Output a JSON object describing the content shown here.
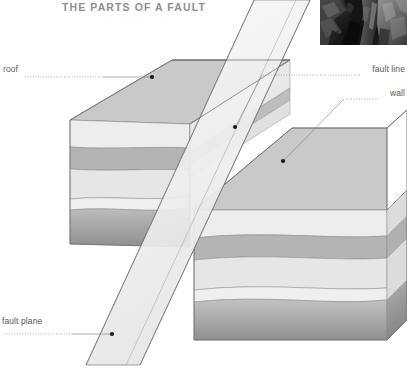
{
  "title": "THE PARTS OF A FAULT",
  "labels": {
    "roof": "roof",
    "fault_line": "fault line",
    "wall": "wall",
    "fault_plane": "fault plane"
  },
  "colors": {
    "title": "#8e8e8e",
    "label": "#59595b",
    "leader": "#9a9a9a",
    "outline": "#6d6d6d",
    "top_face": "#c9c9c9",
    "layer_light": "#ededed",
    "layer_pale": "#e3e3e3",
    "layer_band": "#b4b4b4",
    "layer_deep_top": "#bdbdbd",
    "layer_deep_bottom": "#8f8f8f",
    "fault_plane_fill": "#f2f2f2",
    "photo_bg": "#0d0d0d",
    "background": "#ffffff"
  },
  "diagram": {
    "type": "geological-block-diagram",
    "blocks": [
      {
        "name": "hanging-wall-block-left",
        "position": "upper-left",
        "elevation": "raised",
        "strata_count": 5
      },
      {
        "name": "footwall-block-right",
        "position": "lower-right",
        "elevation": "dropped",
        "strata_count": 5
      }
    ],
    "fault_plane": {
      "name": "fault-plane",
      "orientation": "steeply dipping, trending upper-right to lower-left",
      "translucent": true
    },
    "callouts": [
      {
        "label": "roof",
        "target_x": 152,
        "target_y": 77,
        "text_side": "left"
      },
      {
        "label": "fault line",
        "target_x": 235,
        "target_y": 127,
        "text_side": "right"
      },
      {
        "label": "wall",
        "target_x": 283,
        "target_y": 161,
        "text_side": "right"
      },
      {
        "label": "fault plane",
        "target_x": 112,
        "target_y": 334,
        "text_side": "left"
      }
    ],
    "inset_photo": {
      "name": "fault-outcrop-photo",
      "description": "dark photograph of a rock outcrop showing a fault",
      "x": 320,
      "y": 0,
      "width": 87,
      "height": 45
    }
  }
}
